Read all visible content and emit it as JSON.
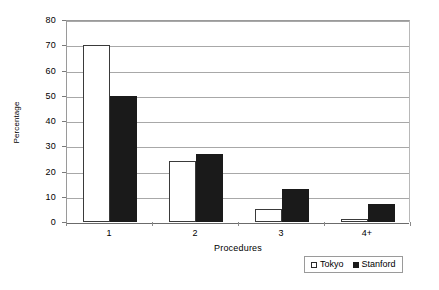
{
  "chart_data": {
    "type": "bar",
    "title": "",
    "subtitle": "",
    "xlabel": "Procedures",
    "ylabel": "Percentage",
    "categories": [
      "1",
      "2",
      "3",
      "4+"
    ],
    "series": [
      {
        "name": "Tokyo",
        "values": [
          70,
          24,
          5,
          1
        ],
        "color": "#ffffff",
        "border_color": "#3a3a3a"
      },
      {
        "name": "Stanford",
        "values": [
          50,
          27,
          13,
          7
        ],
        "color": "#1a1a1a",
        "border_color": "#1a1a1a"
      }
    ],
    "ylim": [
      0,
      80
    ],
    "ytick_values": [
      0,
      10,
      20,
      30,
      40,
      50,
      60,
      70,
      80
    ],
    "ytick_labels": [
      "0",
      "10",
      "20",
      "30",
      "40",
      "50",
      "60",
      "70",
      "80"
    ],
    "grid": true,
    "grid_axis": "y",
    "legend_position": "bottom-right",
    "legend_entries": [
      "Tokyo",
      "Stanford"
    ],
    "background": "#ffffff",
    "annotations": []
  }
}
